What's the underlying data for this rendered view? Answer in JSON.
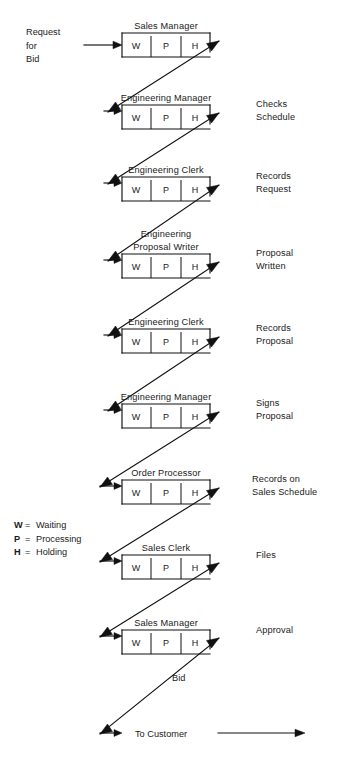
{
  "diagram": {
    "title_visible": false,
    "input_label": {
      "lines": [
        "Request",
        "for",
        "Bid"
      ]
    },
    "legend": {
      "entries": [
        {
          "symbol": "W",
          "equals": "=",
          "meaning": "Waiting"
        },
        {
          "symbol": "P",
          "equals": "=",
          "meaning": "Processing"
        },
        {
          "symbol": "H",
          "equals": "=",
          "meaning": "Holding"
        }
      ]
    },
    "cell_labels": [
      "W",
      "P",
      "H"
    ],
    "steps": [
      {
        "id": "step-1",
        "title_lines": [
          "Sales Manager"
        ],
        "cells": [
          "W",
          "P",
          "H"
        ],
        "side_label_lines": []
      },
      {
        "id": "step-2",
        "title_lines": [
          "Engineering Manager"
        ],
        "cells": [
          "W",
          "P",
          "H"
        ],
        "side_label_lines": [
          "Checks",
          "Schedule"
        ]
      },
      {
        "id": "step-3",
        "title_lines": [
          "Engineering Clerk"
        ],
        "cells": [
          "W",
          "P",
          "H"
        ],
        "side_label_lines": [
          "Records",
          "Request"
        ]
      },
      {
        "id": "step-4",
        "title_lines": [
          "Engineering",
          "Proposal Writer"
        ],
        "cells": [
          "W",
          "P",
          "H"
        ],
        "side_label_lines": [
          "Proposal",
          "Written"
        ]
      },
      {
        "id": "step-5",
        "title_lines": [
          "Engineering Clerk"
        ],
        "cells": [
          "W",
          "P",
          "H"
        ],
        "side_label_lines": [
          "Records",
          "Proposal"
        ]
      },
      {
        "id": "step-6",
        "title_lines": [
          "Engineering Manager"
        ],
        "cells": [
          "W",
          "P",
          "H"
        ],
        "side_label_lines": [
          "Signs",
          "Proposal"
        ]
      },
      {
        "id": "step-7",
        "title_lines": [
          "Order Processor"
        ],
        "cells": [
          "W",
          "P",
          "H"
        ],
        "side_label_lines": [
          "Records on",
          "Sales Schedule"
        ]
      },
      {
        "id": "step-8",
        "title_lines": [
          "Sales Clerk"
        ],
        "cells": [
          "W",
          "P",
          "H"
        ],
        "side_label_lines": [
          "Files"
        ]
      },
      {
        "id": "step-9",
        "title_lines": [
          "Sales Manager"
        ],
        "cells": [
          "W",
          "P",
          "H"
        ],
        "side_label_lines": [
          "Approval"
        ]
      }
    ],
    "final_flow_label": "Bid",
    "output_label": "To Customer"
  }
}
